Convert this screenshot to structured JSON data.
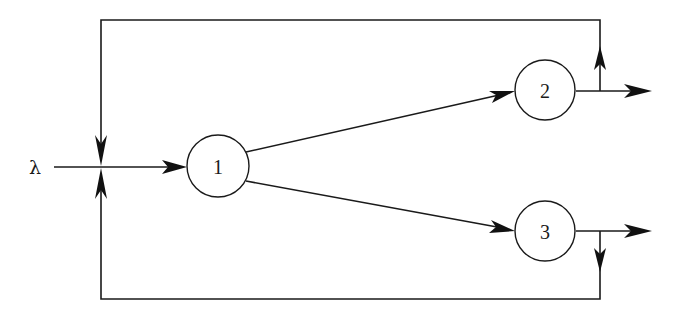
{
  "diagram": {
    "type": "queueing-network",
    "input": {
      "label": "λ",
      "x": 35,
      "y": 167
    },
    "nodes": [
      {
        "id": "1",
        "label": "1",
        "cx": 218,
        "cy": 166,
        "r": 31
      },
      {
        "id": "2",
        "label": "2",
        "cx": 545,
        "cy": 90,
        "r": 30
      },
      {
        "id": "3",
        "label": "3",
        "cx": 545,
        "cy": 231,
        "r": 30
      }
    ],
    "edges": [
      {
        "from": "input",
        "to": "1",
        "kind": "arrival"
      },
      {
        "from": "1",
        "to": "2",
        "kind": "routing"
      },
      {
        "from": "1",
        "to": "3",
        "kind": "routing"
      },
      {
        "from": "2",
        "to": "exit",
        "kind": "departure"
      },
      {
        "from": "3",
        "to": "exit",
        "kind": "departure"
      },
      {
        "from": "2",
        "to": "1",
        "kind": "feedback",
        "path": "top"
      },
      {
        "from": "3",
        "to": "1",
        "kind": "feedback",
        "path": "bottom"
      }
    ],
    "colors": {
      "line": "#1a1a1a",
      "background": "#ffffff"
    }
  }
}
